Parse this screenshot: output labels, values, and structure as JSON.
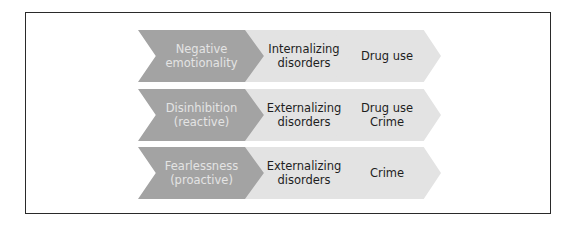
{
  "colors": {
    "trait_fill": "#a3a3a3",
    "trait_text": "#e4e4e4",
    "outcome_fill": "#e3e3e3",
    "outcome_text": "#1e1e1e",
    "frame_border": "#2a2a2a"
  },
  "rows": [
    {
      "trait": "Negative\nemotionality",
      "disorder": "Internalizing\ndisorders",
      "outcome": "Drug use"
    },
    {
      "trait": "Disinhibition\n(reactive)",
      "disorder": "Externalizing\ndisorders",
      "outcome": "Drug use\nCrime"
    },
    {
      "trait": "Fearlessness\n(proactive)",
      "disorder": "Externalizing\ndisorders",
      "outcome": "Crime"
    }
  ]
}
